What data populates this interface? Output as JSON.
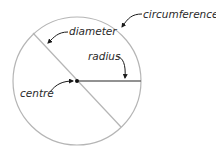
{
  "diagram": {
    "type": "circle-parts",
    "colors": {
      "circle": "#b5b5b5",
      "diameter": "#b5b5b5",
      "radius": "#6e6e6e",
      "centre_dot": "#111111",
      "arrow": "#1a1a1a",
      "text": "#2a2a2a"
    },
    "labels": {
      "circumference": "circumference",
      "diameter": "diameter",
      "radius": "radius",
      "centre": "centre"
    }
  }
}
